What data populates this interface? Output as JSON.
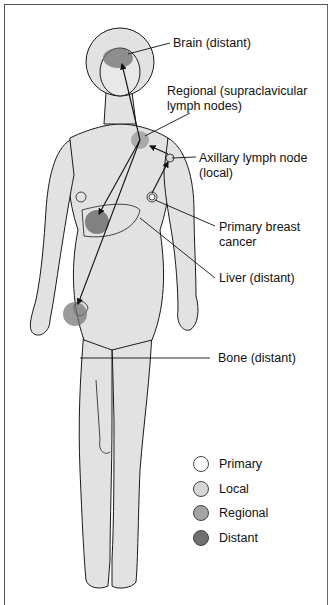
{
  "diagram": {
    "labels": {
      "brain": "Brain (distant)",
      "regional_line1": "Regional (supraclavicular",
      "regional_line2": "lymph nodes)",
      "axillary_line1": "Axillary lymph node",
      "axillary_line2": "(local)",
      "primary_line1": "Primary breast",
      "primary_line2": "cancer",
      "liver": "Liver (distant)",
      "bone": "Bone (distant)"
    },
    "legend": [
      {
        "label": "Primary",
        "color": "#ffffff"
      },
      {
        "label": "Local",
        "color": "#d6d6d6"
      },
      {
        "label": "Regional",
        "color": "#a4a4a4"
      },
      {
        "label": "Distant",
        "color": "#707070"
      }
    ],
    "colors": {
      "skin": "#e2e2e2",
      "outline": "#1a1a1a",
      "distant": "#707070",
      "regional": "#a4a4a4"
    }
  }
}
